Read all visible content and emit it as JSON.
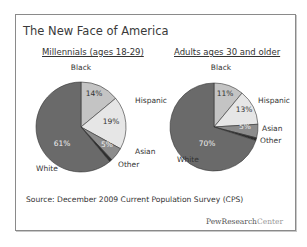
{
  "slide": {
    "title": "The New Face of America",
    "source": "Source: December 2009 Current Population Survey (CPS)",
    "logo": {
      "part1": "PewResearch",
      "part2": "Center"
    }
  },
  "chart_data": [
    {
      "type": "pie",
      "title": "Millennials (ages 18-29)",
      "categories": [
        "Black",
        "Hispanic",
        "Asian",
        "Other",
        "White"
      ],
      "values": [
        14,
        19,
        5,
        1,
        61
      ],
      "data_labels": [
        "14%",
        "19%",
        "5%",
        "",
        "61%"
      ],
      "colors": [
        "#c4c4c4",
        "#e6e6e6",
        "#8c8c8c",
        "#2e2e2e",
        "#6a6a6a"
      ]
    },
    {
      "type": "pie",
      "title": "Adults ages 30 and older",
      "categories": [
        "Black",
        "Hispanic",
        "Asian",
        "Other",
        "White"
      ],
      "values": [
        11,
        13,
        5,
        1,
        70
      ],
      "data_labels": [
        "11%",
        "13%",
        "5%",
        "",
        "70%"
      ],
      "colors": [
        "#c4c4c4",
        "#e6e6e6",
        "#8c8c8c",
        "#2e2e2e",
        "#6a6a6a"
      ]
    }
  ]
}
